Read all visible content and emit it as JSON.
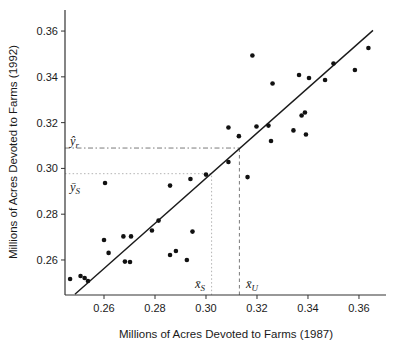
{
  "figure": {
    "background": "#ffffff",
    "x_axis": {
      "label": "Millions of Acres Devoted to Farms (1987)",
      "tick_labels": [
        "0.26",
        "0.28",
        "0.30",
        "0.32",
        "0.34",
        "0.36"
      ]
    },
    "y_axis": {
      "label": "Millions of Acres Devoted to Farms (1992)",
      "tick_labels": [
        "0.26",
        "0.28",
        "0.30",
        "0.32",
        "0.34",
        "0.36"
      ]
    },
    "annotations": {
      "y_hat_r": {
        "base": "ŷ",
        "sub": "r"
      },
      "y_bar_S": {
        "base": "ȳ",
        "sub": "S"
      },
      "x_bar_S": {
        "base": "x̄",
        "sub": "S"
      },
      "x_bar_U": {
        "base": "x̄",
        "sub": "U"
      }
    },
    "colors": {
      "point": "#111111",
      "regression_line": "#1a1a1a",
      "axis": "#333333",
      "dotted_ref": "#b3b3b3",
      "dashed_ref": "#7a7a7a"
    }
  },
  "chart_data": {
    "type": "scatter",
    "title": "",
    "xlabel": "Millions of Acres Devoted to Farms (1987)",
    "ylabel": "Millions of Acres Devoted to Farms (1992)",
    "xlim": [
      0.2447,
      0.3706
    ],
    "ylim": [
      0.2447,
      0.3692
    ],
    "x_ticks": [
      0.26,
      0.28,
      0.3,
      0.32,
      0.34,
      0.36
    ],
    "y_ticks": [
      0.26,
      0.28,
      0.3,
      0.32,
      0.34,
      0.36
    ],
    "grid": false,
    "legend": null,
    "points": [
      [
        0.2467,
        0.2517
      ],
      [
        0.2508,
        0.253
      ],
      [
        0.2524,
        0.2521
      ],
      [
        0.2537,
        0.2508
      ],
      [
        0.26,
        0.2687
      ],
      [
        0.2618,
        0.2631
      ],
      [
        0.2676,
        0.2703
      ],
      [
        0.2706,
        0.2703
      ],
      [
        0.2682,
        0.2593
      ],
      [
        0.2702,
        0.2591
      ],
      [
        0.2604,
        0.2936
      ],
      [
        0.2788,
        0.2729
      ],
      [
        0.2814,
        0.2772
      ],
      [
        0.2859,
        0.2925
      ],
      [
        0.2859,
        0.2622
      ],
      [
        0.2882,
        0.2639
      ],
      [
        0.2925,
        0.26
      ],
      [
        0.2939,
        0.2954
      ],
      [
        0.2947,
        0.2724
      ],
      [
        0.3,
        0.2973
      ],
      [
        0.3088,
        0.3028
      ],
      [
        0.3088,
        0.3179
      ],
      [
        0.3129,
        0.3141
      ],
      [
        0.3163,
        0.2962
      ],
      [
        0.3182,
        0.3493
      ],
      [
        0.3198,
        0.3183
      ],
      [
        0.3245,
        0.3187
      ],
      [
        0.3255,
        0.312
      ],
      [
        0.3261,
        0.3371
      ],
      [
        0.3343,
        0.3166
      ],
      [
        0.3392,
        0.3148
      ],
      [
        0.3375,
        0.3231
      ],
      [
        0.3388,
        0.3244
      ],
      [
        0.3365,
        0.3408
      ],
      [
        0.3404,
        0.3395
      ],
      [
        0.3467,
        0.3386
      ],
      [
        0.35,
        0.3458
      ],
      [
        0.3584,
        0.343
      ],
      [
        0.3637,
        0.3526
      ]
    ],
    "regression_line": {
      "x1": 0.2486,
      "y1": 0.245,
      "x2": 0.3655,
      "y2": 0.3603
    },
    "reference_lines": {
      "x_bar_S": {
        "axis": "x",
        "value": 0.3022,
        "to_y": 0.2977,
        "style": "dotted",
        "label": "x̄S"
      },
      "y_bar_S": {
        "axis": "y",
        "value": 0.2977,
        "to_x": 0.3022,
        "style": "dotted",
        "label": "ȳS"
      },
      "x_bar_U": {
        "axis": "x",
        "value": 0.3131,
        "to_y": 0.3089,
        "style": "dashed",
        "label": "x̄U"
      },
      "y_hat_r": {
        "axis": "y",
        "value": 0.3089,
        "to_x": 0.3131,
        "style": "dashdot",
        "label": "ŷr"
      }
    }
  }
}
